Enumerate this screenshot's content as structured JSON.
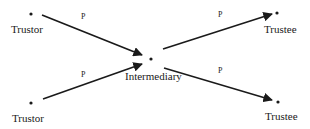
{
  "diagram": {
    "nodes": [
      {
        "id": "trustor_top",
        "label": "Trustor"
      },
      {
        "id": "trustor_bottom",
        "label": "Trustor"
      },
      {
        "id": "intermediary",
        "label": "Intermediary"
      },
      {
        "id": "trustee_top",
        "label": "Trustee"
      },
      {
        "id": "trustee_bottom",
        "label": "Trustee"
      }
    ],
    "edges": [
      {
        "from": "trustor_top",
        "to": "intermediary",
        "label": "P"
      },
      {
        "from": "trustor_bottom",
        "to": "intermediary",
        "label": "P"
      },
      {
        "from": "intermediary",
        "to": "trustee_top",
        "label": "P"
      },
      {
        "from": "intermediary",
        "to": "trustee_bottom",
        "label": "P"
      }
    ],
    "colors": {
      "ink": "#1a1a1a",
      "background": "#ffffff"
    }
  }
}
